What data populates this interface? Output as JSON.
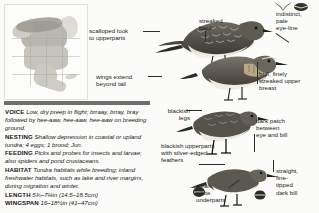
{
  "page": {
    "width": 319,
    "height": 213,
    "background": "#fbfbf9",
    "text_color": "#1b1b1b"
  },
  "range_map": {
    "name": "north-america-range-map",
    "colors": {
      "land": "#cfcdc6",
      "breeding": "#9a9890",
      "canada": "#b9b7af",
      "greenland": "#dedcd5"
    }
  },
  "annotations": [
    {
      "id": "scalloped-look",
      "text": "scalloped look\nto upperparts"
    },
    {
      "id": "wings-extend",
      "text": "wings extend\nbeyond tail"
    },
    {
      "id": "streaked-back",
      "text": "streaked\nback"
    },
    {
      "id": "eye-line",
      "text": "indistinct,\npale\neye-line"
    },
    {
      "id": "buff-breast",
      "text": "buff, finely\nstreaked upper\nbreast"
    },
    {
      "id": "blackish-legs",
      "text": "blackish\nlegs"
    },
    {
      "id": "dark-patch",
      "text": "dark patch\nbetween\neye and bill"
    },
    {
      "id": "blackish-upperparts",
      "text": "blackish upperparts\nwith silver-edged\nfeathers"
    },
    {
      "id": "dark-bill",
      "text": "straight,\nfine-\ntipped\ndark bill"
    },
    {
      "id": "clean-white",
      "text": "clean\nwhite\nunderparts"
    }
  ],
  "info": {
    "rows": [
      {
        "key": "VOICE",
        "value": "Low, dry preep in flight; brraay, brray, bray followed by hee-aaw, hee-aaw, hee-aaw on breeding ground."
      },
      {
        "key": "NESTING",
        "value": "Shallow depression in coastal or upland tundra; 4 eggs; 1 brood; Jun."
      },
      {
        "key": "FEEDING",
        "value": "Picks and probes for insects and larvae; also spiders and pond crustaceans."
      },
      {
        "key": "HABITAT",
        "value": "Tundra habitats while breeding; inland freshwater habitats, such as lake and river margins, during migration and winter."
      },
      {
        "key": "LENGTH",
        "value": "5¾–7¼in (14.5–18.5cm)"
      },
      {
        "key": "WINGSPAN",
        "value": "16–18½in (41–47cm)"
      }
    ]
  }
}
